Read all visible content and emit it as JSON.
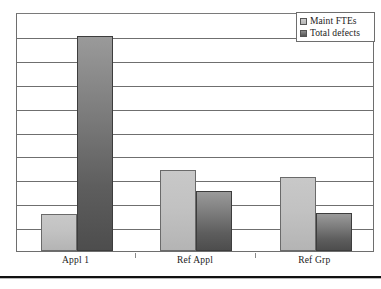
{
  "chart_data": {
    "type": "bar",
    "title": "",
    "subtitle": "",
    "xlabel": "",
    "ylabel": "",
    "categories": [
      "Appl 1",
      "Ref Appl",
      "Ref Grp"
    ],
    "series": [
      {
        "name": "Maint FTEs",
        "values": [
          1.55,
          3.4,
          3.1
        ],
        "color": "#c2c2c2"
      },
      {
        "name": "Total defects",
        "values": [
          9.0,
          2.5,
          1.6
        ],
        "color": "#5e5e5e"
      }
    ],
    "ylim": [
      0,
      10
    ],
    "y_tick_step": 1,
    "y_tick_labels_visible": false,
    "grid": true,
    "grid_axis": "y",
    "legend_position": "top-right",
    "legend_entries": [
      "Maint FTEs",
      "Total defects"
    ],
    "annotations": []
  },
  "legend": {
    "items": [
      {
        "label": "Maint FTEs",
        "swatch": "legend-swatch-maint-ftes"
      },
      {
        "label": "Total defects",
        "swatch": "legend-swatch-total-defects"
      }
    ]
  },
  "axis": {
    "categories": [
      "Appl 1",
      "Ref Appl",
      "Ref Grp"
    ]
  },
  "colors": {
    "series_maint_ftes": "#c2c2c2",
    "series_total_defects": "#5e5e5e",
    "gridline": "#6f6f6f",
    "plot_border": "#6e6e6e",
    "bottom_rule": "#111111",
    "text": "#1a1a1a",
    "background": "#ffffff"
  }
}
